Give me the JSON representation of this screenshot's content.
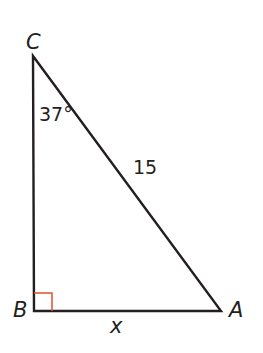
{
  "diagram": {
    "type": "right-triangle",
    "vertices": {
      "C": {
        "label": "C",
        "x": 33,
        "y": 56
      },
      "B": {
        "label": "B",
        "x": 34,
        "y": 311
      },
      "A": {
        "label": "A",
        "x": 221,
        "y": 311
      }
    },
    "angle_C": "37°",
    "hypotenuse_CA": "15",
    "side_BA": "x",
    "right_angle_at": "B",
    "colors": {
      "line": "#231f20",
      "right_angle_marker": "#e2522b"
    }
  }
}
